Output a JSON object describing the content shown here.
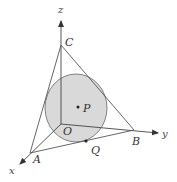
{
  "figure": {
    "type": "3d-geometry-diagram",
    "colors": {
      "circle_fill": "#d9d9d9",
      "circle_stroke": "#555555",
      "lines": "#555555",
      "text": "#333333",
      "background": "#ffffff"
    },
    "axes": {
      "x": {
        "label": "x"
      },
      "y": {
        "label": "y"
      },
      "z": {
        "label": "z"
      }
    },
    "points": {
      "O": {
        "label": "O"
      },
      "A": {
        "label": "A"
      },
      "B": {
        "label": "B"
      },
      "C": {
        "label": "C"
      },
      "P": {
        "label": "P"
      },
      "Q": {
        "label": "Q"
      }
    },
    "edges": [
      "OA",
      "OB",
      "OC",
      "AB",
      "BC",
      "CA"
    ]
  }
}
